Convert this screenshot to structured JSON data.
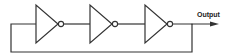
{
  "diagram": {
    "type": "ring-oscillator",
    "output_label": "Output",
    "stroke_color": "#333333",
    "inverters": [
      {
        "id": "inverter-1"
      },
      {
        "id": "inverter-2"
      },
      {
        "id": "inverter-3"
      }
    ],
    "feedback": "output of inverter-3 fed back to input of inverter-1"
  }
}
